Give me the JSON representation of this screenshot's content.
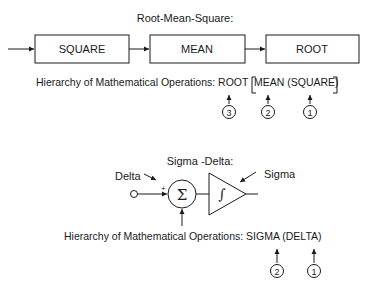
{
  "rms": {
    "title": "Root-Mean-Square:",
    "blocks": [
      {
        "label": "SQUARE"
      },
      {
        "label": "MEAN"
      },
      {
        "label": "ROOT"
      }
    ],
    "hierarchy": {
      "prefix": "Hierarchy of Mathematical Operations: ROOT",
      "bracket_open": "[",
      "inner": "MEAN (SQUARE)",
      "bracket_close": "]",
      "markers": [
        "3",
        "2",
        "1"
      ]
    }
  },
  "sigma_delta": {
    "title": "Sigma -Delta:",
    "delta_label": "Delta",
    "sigma_label": "Sigma",
    "sum_symbol": "Σ",
    "plus_sign": "+",
    "integral_symbol": "∫",
    "hierarchy": {
      "text": "Hierarchy of Mathematical Operations: SIGMA (DELTA)",
      "markers": [
        "2",
        "1"
      ]
    }
  }
}
